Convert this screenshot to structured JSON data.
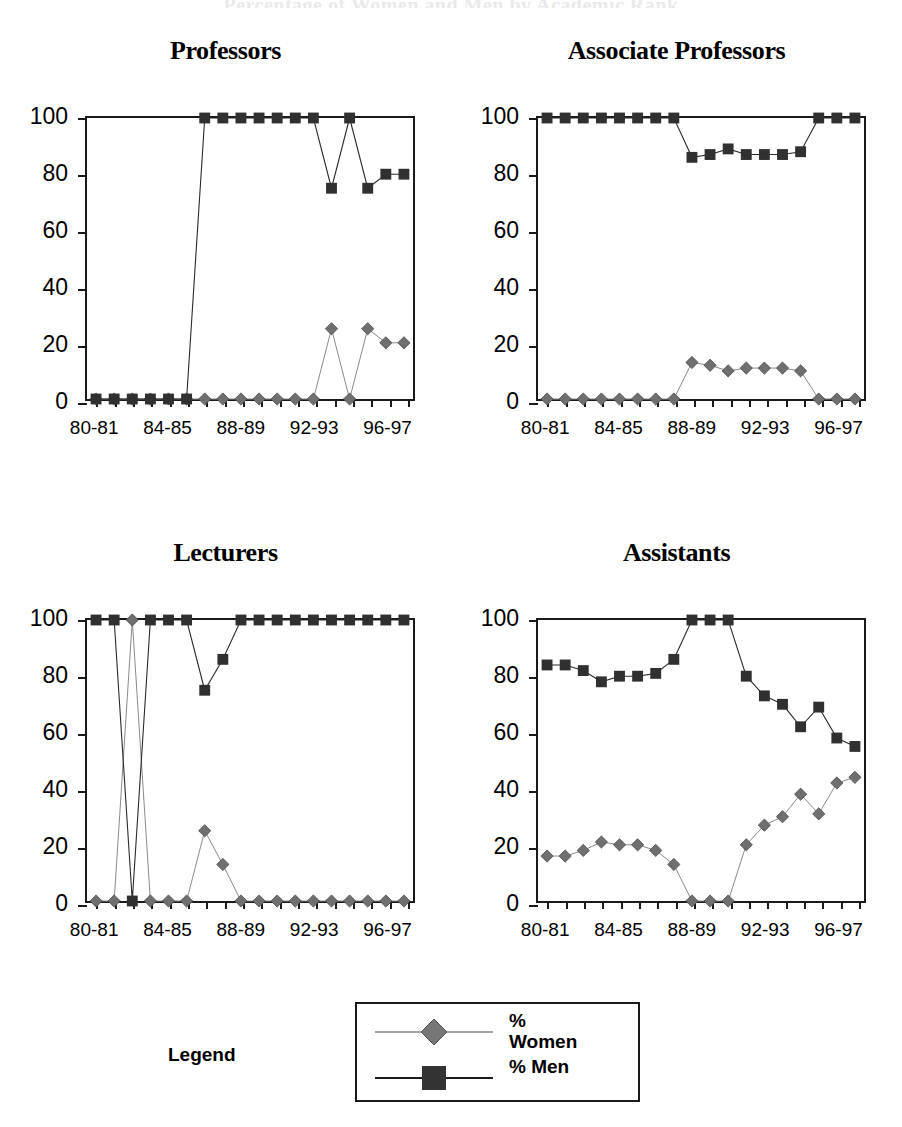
{
  "figure": {
    "suptitle": "Percentage of Women and Men by Academic Rank"
  },
  "legend": {
    "label": "Legend",
    "entries": [
      {
        "name": "women",
        "label": "%\nWomen",
        "marker": "diamond",
        "color": "#666666"
      },
      {
        "name": "men",
        "label": "% Men",
        "marker": "square",
        "color": "#333333"
      }
    ]
  },
  "axis": {
    "y_ticks": [
      0,
      20,
      40,
      60,
      80,
      100
    ],
    "ylim": [
      0,
      100
    ],
    "x_tick_labels": [
      "80-81",
      "",
      "82-83",
      "",
      "84-85",
      "",
      "86-87",
      "",
      "88-89",
      "",
      "90-91",
      "",
      "92-93",
      "",
      "94-95",
      "",
      "96-97",
      ""
    ],
    "x_visible_labels": [
      "80-81",
      "84-85",
      "88-89",
      "92-93",
      "96-97"
    ]
  },
  "chart_data": [
    {
      "type": "line",
      "title": "Professors",
      "xlabel": "",
      "ylabel": "",
      "ylim": [
        0,
        100
      ],
      "grid": false,
      "legend_position": "figure-bottom",
      "categories": [
        "80-81",
        "81-82",
        "82-83",
        "83-84",
        "84-85",
        "85-86",
        "86-87",
        "87-88",
        "88-89",
        "89-90",
        "90-91",
        "91-92",
        "92-93",
        "93-94",
        "94-95",
        "95-96",
        "96-97",
        "97-98"
      ],
      "series": [
        {
          "name": "% Women",
          "marker": "diamond",
          "color": "#666666",
          "values": [
            0,
            0,
            0,
            0,
            0,
            0,
            0,
            0,
            0,
            0,
            0,
            0,
            0,
            25,
            0,
            25,
            20,
            20
          ]
        },
        {
          "name": "% Men",
          "marker": "square",
          "color": "#333333",
          "values": [
            0,
            0,
            0,
            0,
            0,
            0,
            100,
            100,
            100,
            100,
            100,
            100,
            100,
            75,
            100,
            75,
            80,
            80
          ]
        }
      ]
    },
    {
      "type": "line",
      "title": "Associate Professors",
      "xlabel": "",
      "ylabel": "",
      "ylim": [
        0,
        100
      ],
      "grid": false,
      "legend_position": "figure-bottom",
      "categories": [
        "80-81",
        "81-82",
        "82-83",
        "83-84",
        "84-85",
        "85-86",
        "86-87",
        "87-88",
        "88-89",
        "89-90",
        "90-91",
        "91-92",
        "92-93",
        "93-94",
        "94-95",
        "95-96",
        "96-97",
        "97-98"
      ],
      "series": [
        {
          "name": "% Women",
          "marker": "diamond",
          "color": "#666666",
          "values": [
            0,
            0,
            0,
            0,
            0,
            0,
            0,
            0,
            13,
            12,
            10,
            11,
            11,
            11,
            10,
            0,
            0,
            0
          ]
        },
        {
          "name": "% Men",
          "marker": "square",
          "color": "#333333",
          "values": [
            100,
            100,
            100,
            100,
            100,
            100,
            100,
            100,
            86,
            87,
            89,
            87,
            87,
            87,
            88,
            100,
            100,
            100
          ]
        }
      ]
    },
    {
      "type": "line",
      "title": "Lecturers",
      "xlabel": "",
      "ylabel": "",
      "ylim": [
        0,
        100
      ],
      "grid": false,
      "legend_position": "figure-bottom",
      "categories": [
        "80-81",
        "81-82",
        "82-83",
        "83-84",
        "84-85",
        "85-86",
        "86-87",
        "87-88",
        "88-89",
        "89-90",
        "90-91",
        "91-92",
        "92-93",
        "93-94",
        "94-95",
        "95-96",
        "96-97",
        "97-98"
      ],
      "series": [
        {
          "name": "% Women",
          "marker": "diamond",
          "color": "#666666",
          "values": [
            0,
            0,
            100,
            0,
            0,
            0,
            25,
            13,
            0,
            0,
            0,
            0,
            0,
            0,
            0,
            0,
            0,
            0
          ]
        },
        {
          "name": "% Men",
          "marker": "square",
          "color": "#333333",
          "values": [
            100,
            100,
            0,
            100,
            100,
            100,
            75,
            86,
            100,
            100,
            100,
            100,
            100,
            100,
            100,
            100,
            100,
            100
          ]
        }
      ]
    },
    {
      "type": "line",
      "title": "Assistants",
      "xlabel": "",
      "ylabel": "",
      "ylim": [
        0,
        100
      ],
      "grid": false,
      "legend_position": "figure-bottom",
      "categories": [
        "80-81",
        "81-82",
        "82-83",
        "83-84",
        "84-85",
        "85-86",
        "86-87",
        "87-88",
        "88-89",
        "89-90",
        "90-91",
        "91-92",
        "92-93",
        "93-94",
        "94-95",
        "95-96",
        "96-97",
        "97-98"
      ],
      "series": [
        {
          "name": "% Women",
          "marker": "diamond",
          "color": "#666666",
          "values": [
            16,
            16,
            18,
            21,
            20,
            20,
            18,
            13,
            0,
            0,
            0,
            20,
            27,
            30,
            38,
            31,
            42,
            44
          ]
        },
        {
          "name": "% Men",
          "marker": "square",
          "color": "#333333",
          "values": [
            84,
            84,
            82,
            78,
            80,
            80,
            81,
            86,
            100,
            100,
            100,
            80,
            73,
            70,
            62,
            69,
            58,
            55
          ]
        }
      ]
    }
  ]
}
